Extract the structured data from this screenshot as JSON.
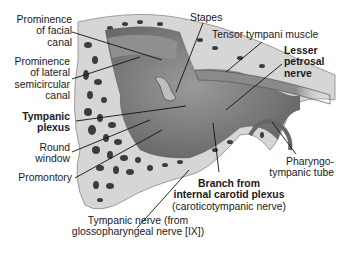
{
  "diagram": {
    "colors": {
      "background": "#ffffff",
      "text": "#1a1a1a",
      "leader": "#111111",
      "bone": "#d9d9d9",
      "cavity": "#7a7a7a",
      "marrow": "#3a3a3a"
    },
    "labels": {
      "prominence_facial": [
        "Prominence",
        "of facial",
        "canal"
      ],
      "prominence_lateral": [
        "Prominence",
        "of lateral",
        "semicircular",
        "canal"
      ],
      "tympanic_plexus": [
        "Tympanic",
        "plexus"
      ],
      "round_window": [
        "Round",
        "window"
      ],
      "promontory": "Promontory",
      "stapes": "Stapes",
      "tensor_tympani": "Tensor tympani muscle",
      "lesser_petrosal": [
        "Lesser",
        "petrosal",
        "nerve"
      ],
      "pharyngotympanic": [
        "Pharyngo-",
        "tympanic tube"
      ],
      "branch_carotid": [
        "Branch from",
        "internal carotid plexus"
      ],
      "caroticotympanic": "(caroticotympanic nerve)",
      "tympanic_nerve": [
        "Tympanic nerve (from",
        "glossopharyngeal nerve [IX])"
      ]
    }
  }
}
